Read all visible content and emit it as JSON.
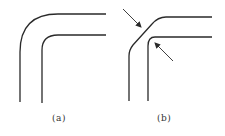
{
  "figures": [
    {
      "id": "a",
      "label": "(a)",
      "description": "pipe bend with smooth rounded corners (inner and outer)"
    },
    {
      "id": "b",
      "label": "(b)",
      "description": "pipe bend with sharp/bevelled outer corner and tight inner corner, indicated by arrows"
    }
  ],
  "colors": {
    "stroke": "#2a2a2a",
    "background": "#ffffff"
  }
}
